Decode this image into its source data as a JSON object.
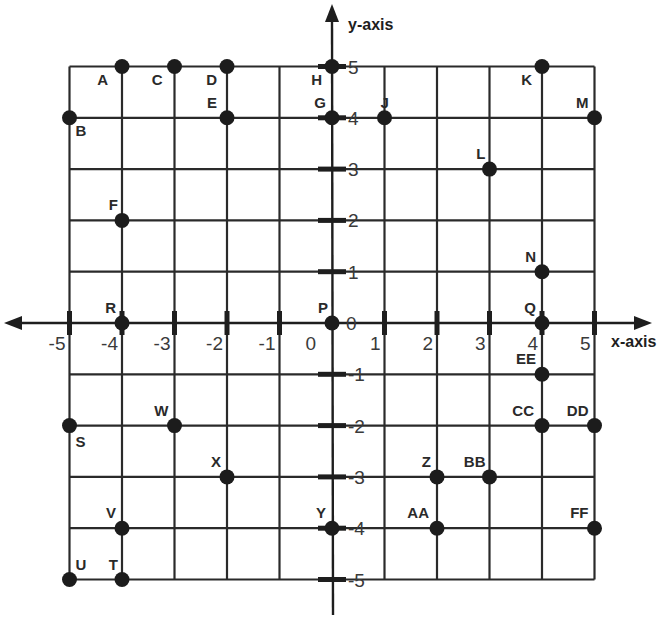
{
  "chart_data": {
    "type": "scatter",
    "title": "",
    "xlabel": "x-axis",
    "ylabel": "y-axis",
    "xlim": [
      -5,
      5
    ],
    "ylim": [
      -5,
      5
    ],
    "grid": true,
    "x_ticks": [
      "-5",
      "-4",
      "-3",
      "-2",
      "-1",
      "0",
      "1",
      "2",
      "3",
      "4",
      "5"
    ],
    "y_ticks": [
      "5",
      "4",
      "3",
      "2",
      "1",
      "0",
      "-1",
      "-2",
      "-3",
      "-4",
      "-5"
    ],
    "points": [
      {
        "label": "A",
        "x": -4,
        "y": 5
      },
      {
        "label": "B",
        "x": -5,
        "y": 4
      },
      {
        "label": "C",
        "x": -3,
        "y": 5
      },
      {
        "label": "D",
        "x": -2,
        "y": 5
      },
      {
        "label": "E",
        "x": -2,
        "y": 4
      },
      {
        "label": "F",
        "x": -4,
        "y": 2
      },
      {
        "label": "G",
        "x": 0,
        "y": 4
      },
      {
        "label": "H",
        "x": 0,
        "y": 5
      },
      {
        "label": "J",
        "x": 1,
        "y": 4
      },
      {
        "label": "K",
        "x": 4,
        "y": 5
      },
      {
        "label": "L",
        "x": 3,
        "y": 3
      },
      {
        "label": "M",
        "x": 5,
        "y": 4
      },
      {
        "label": "N",
        "x": 4,
        "y": 1
      },
      {
        "label": "P",
        "x": 0,
        "y": 0
      },
      {
        "label": "Q",
        "x": 4,
        "y": 0
      },
      {
        "label": "R",
        "x": -4,
        "y": 0
      },
      {
        "label": "S",
        "x": -5,
        "y": -2
      },
      {
        "label": "T",
        "x": -4,
        "y": -5
      },
      {
        "label": "U",
        "x": -5,
        "y": -5
      },
      {
        "label": "V",
        "x": -4,
        "y": -4
      },
      {
        "label": "W",
        "x": -3,
        "y": -2
      },
      {
        "label": "X",
        "x": -2,
        "y": -3
      },
      {
        "label": "Y",
        "x": 0,
        "y": -4
      },
      {
        "label": "Z",
        "x": 2,
        "y": -3
      },
      {
        "label": "AA",
        "x": 2,
        "y": -4
      },
      {
        "label": "BB",
        "x": 3,
        "y": -3
      },
      {
        "label": "CC",
        "x": 4,
        "y": -2
      },
      {
        "label": "DD",
        "x": 5,
        "y": -2
      },
      {
        "label": "EE",
        "x": 4,
        "y": -1
      },
      {
        "label": "FF",
        "x": 5,
        "y": -4
      }
    ]
  },
  "labels": {
    "x_axis_title": "x-axis",
    "y_axis_title": "y-axis",
    "origin_x_label": "0",
    "origin_y_label": "0"
  }
}
